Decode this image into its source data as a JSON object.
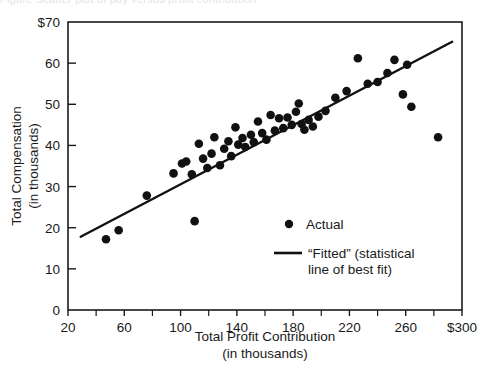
{
  "figure": {
    "cropped_header_text": "Figure   Scatter plot of pay versus profit contribution"
  },
  "chart_data": {
    "type": "scatter",
    "title": "",
    "xlabel": "Total Profit Contribution",
    "xlabel_sub": "(in thousands)",
    "ylabel": "Total Compensation",
    "ylabel_sub": "(in thousands)",
    "xlim": [
      20,
      300
    ],
    "ylim": [
      0,
      70
    ],
    "grid": false,
    "x_ticks": [
      20,
      60,
      100,
      140,
      180,
      220,
      260,
      300
    ],
    "x_tick_labels": [
      "20",
      "60",
      "100",
      "140",
      "180",
      "220",
      "260",
      "$300"
    ],
    "x_minor_ticks": [
      40,
      80,
      120,
      160,
      200,
      240,
      280
    ],
    "y_ticks": [
      0,
      10,
      20,
      30,
      40,
      50,
      60,
      70
    ],
    "y_tick_labels": [
      "0",
      "10",
      "20",
      "30",
      "40",
      "50",
      "60",
      "$70"
    ],
    "legend_position": "inside-lower-right",
    "series": [
      {
        "name": "Actual",
        "type": "scatter",
        "marker": "circle",
        "color": "#111111",
        "points": [
          [
            47,
            17.2
          ],
          [
            56,
            19.4
          ],
          [
            76,
            27.8
          ],
          [
            95,
            33.2
          ],
          [
            101,
            35.6
          ],
          [
            104,
            36.1
          ],
          [
            108,
            33.0
          ],
          [
            110,
            21.6
          ],
          [
            113,
            40.4
          ],
          [
            116,
            36.8
          ],
          [
            119,
            34.5
          ],
          [
            122,
            38.0
          ],
          [
            124,
            42.0
          ],
          [
            128,
            35.2
          ],
          [
            131,
            39.2
          ],
          [
            134,
            41.0
          ],
          [
            136,
            37.4
          ],
          [
            139,
            44.4
          ],
          [
            141,
            40.2
          ],
          [
            144,
            41.8
          ],
          [
            146,
            39.6
          ],
          [
            150,
            42.6
          ],
          [
            152,
            40.8
          ],
          [
            155,
            45.8
          ],
          [
            158,
            43.0
          ],
          [
            161,
            41.4
          ],
          [
            164,
            47.4
          ],
          [
            167,
            43.6
          ],
          [
            170,
            46.6
          ],
          [
            173,
            44.2
          ],
          [
            176,
            46.8
          ],
          [
            179,
            45.0
          ],
          [
            182,
            48.2
          ],
          [
            184,
            50.2
          ],
          [
            186,
            45.2
          ],
          [
            188,
            43.8
          ],
          [
            191,
            46.2
          ],
          [
            194,
            44.6
          ],
          [
            198,
            47.0
          ],
          [
            203,
            48.4
          ],
          [
            210,
            51.6
          ],
          [
            218,
            53.2
          ],
          [
            226,
            61.2
          ],
          [
            233,
            55.0
          ],
          [
            240,
            55.4
          ],
          [
            247,
            57.6
          ],
          [
            252,
            60.8
          ],
          [
            258,
            52.4
          ],
          [
            261,
            59.6
          ],
          [
            264,
            49.4
          ],
          [
            283,
            42.0
          ]
        ]
      },
      {
        "name": "“Fitted” (statistical line of best fit)",
        "type": "line",
        "color": "#111111",
        "endpoints": [
          [
            29,
            17.8
          ],
          [
            293,
            65.2
          ]
        ]
      }
    ],
    "legend_entries": [
      {
        "marker": "dot",
        "label": "Actual"
      },
      {
        "marker": "line",
        "label": "“Fitted” (statistical",
        "label2": "line of best fit)"
      }
    ]
  },
  "colors": {
    "axis": "#1a1a1a",
    "marker": "#111111",
    "fit_line": "#111111",
    "background": "#ffffff"
  }
}
